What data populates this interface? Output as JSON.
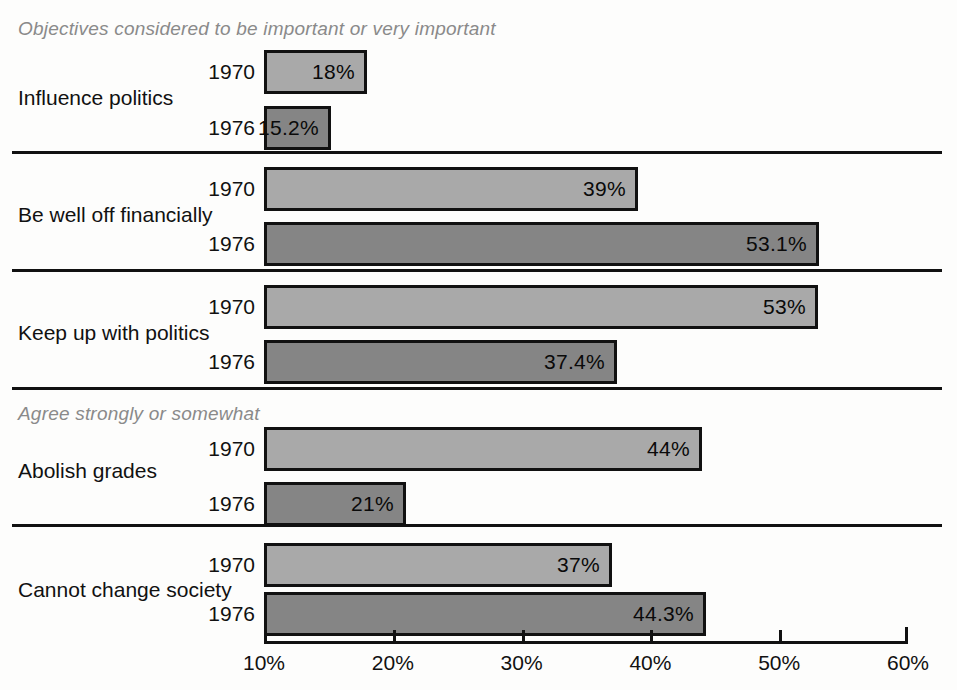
{
  "chart_data": {
    "type": "bar",
    "orientation": "horizontal",
    "title": "",
    "xlabel": "",
    "ylabel": "",
    "xlim": [
      10,
      60
    ],
    "grid": false,
    "legend": "none",
    "xticks": [
      "10%",
      "20%",
      "30%",
      "40%",
      "50%",
      "60%"
    ],
    "xtick_values": [
      10,
      20,
      30,
      40,
      50,
      60
    ],
    "series": [
      {
        "name": "1970",
        "values": [
          18,
          39,
          53,
          44,
          37
        ]
      },
      {
        "name": "1976",
        "values": [
          15.2,
          53.1,
          37.4,
          21,
          44.3
        ]
      }
    ],
    "categories": [
      "Influence politics",
      "Be well off financially",
      "Keep up with politics",
      "Abolish grades",
      "Cannot change society"
    ],
    "section_captions": [
      "Objectives considered to be important or very important",
      "Agree strongly or somewhat"
    ],
    "colors": {
      "series_1970": "#a9a9a9",
      "series_1976": "#858585",
      "outline": "#111111",
      "caption": "#8a8a8a",
      "background": "#fdfdfc"
    },
    "groups": [
      {
        "label": "Influence politics",
        "caption": "Objectives considered to be important or very important",
        "bars": [
          {
            "year": "1970",
            "value": 18,
            "value_label": "18%",
            "shade": "light"
          },
          {
            "year": "1976",
            "value": 15.2,
            "value_label": "15.2%",
            "shade": "dark"
          }
        ]
      },
      {
        "label": "Be well off financially",
        "caption": "",
        "bars": [
          {
            "year": "1970",
            "value": 39,
            "value_label": "39%",
            "shade": "light"
          },
          {
            "year": "1976",
            "value": 53.1,
            "value_label": "53.1%",
            "shade": "dark"
          }
        ]
      },
      {
        "label": "Keep up with politics",
        "caption": "",
        "bars": [
          {
            "year": "1970",
            "value": 53,
            "value_label": "53%",
            "shade": "light"
          },
          {
            "year": "1976",
            "value": 37.4,
            "value_label": "37.4%",
            "shade": "dark"
          }
        ]
      },
      {
        "label": "Abolish grades",
        "caption": "Agree strongly or somewhat",
        "bars": [
          {
            "year": "1970",
            "value": 44,
            "value_label": "44%",
            "shade": "light"
          },
          {
            "year": "1976",
            "value": 21,
            "value_label": "21%",
            "shade": "dark"
          }
        ]
      },
      {
        "label": "Cannot change society",
        "caption": "",
        "bars": [
          {
            "year": "1970",
            "value": 37,
            "value_label": "37%",
            "shade": "light"
          },
          {
            "year": "1976",
            "value": 44.3,
            "value_label": "44.3%",
            "shade": "dark"
          }
        ]
      }
    ]
  },
  "layout": {
    "axis_x0_px": 264,
    "axis_x1_px": 908,
    "axis_y_px": 641,
    "bar_left_px": 264,
    "caption_left_px": 18,
    "group_label_left_px": 18,
    "rows": [
      {
        "caption_y": 18,
        "label_y": 86,
        "bar1_y": 50,
        "bar2_y": 106,
        "sep_y": null
      },
      {
        "caption_y": null,
        "label_y": 203,
        "bar1_y": 167,
        "bar2_y": 222,
        "sep_y": 151
      },
      {
        "caption_y": null,
        "label_y": 321,
        "bar1_y": 285,
        "bar2_y": 340,
        "sep_y": 269
      },
      {
        "caption_y": 403,
        "label_y": 459,
        "bar1_y": 427,
        "bar2_y": 482,
        "sep_y": 387
      },
      {
        "caption_y": null,
        "label_y": 578,
        "bar1_y": 543,
        "bar2_y": 592,
        "sep_y": 524
      }
    ]
  }
}
